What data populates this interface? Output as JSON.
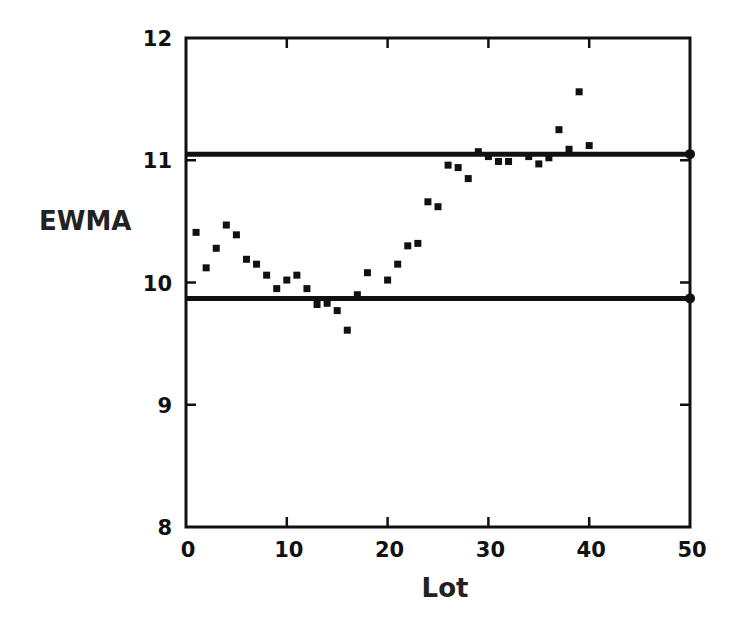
{
  "chart_data": {
    "type": "scatter",
    "title": "",
    "xlabel": "Lot",
    "ylabel": "EWMA",
    "xlim": [
      0,
      50
    ],
    "ylim": [
      8,
      12
    ],
    "xticks": [
      0,
      10,
      20,
      30,
      40,
      50
    ],
    "yticks": [
      8,
      9,
      10,
      11,
      12
    ],
    "xtick_labels": [
      "0",
      "10",
      "20",
      "30",
      "40",
      "50"
    ],
    "ytick_labels": [
      "8",
      "9",
      "10",
      "11",
      "12"
    ],
    "grid": false,
    "legend": null,
    "control_limits": {
      "upper": 11.05,
      "lower": 9.87
    },
    "series": [
      {
        "name": "EWMA",
        "marker": "square",
        "color": "#111111",
        "points": [
          [
            1,
            10.41
          ],
          [
            2,
            10.12
          ],
          [
            3,
            10.28
          ],
          [
            4,
            10.47
          ],
          [
            5,
            10.39
          ],
          [
            6,
            10.19
          ],
          [
            7,
            10.15
          ],
          [
            8,
            10.06
          ],
          [
            9,
            9.95
          ],
          [
            10,
            10.02
          ],
          [
            11,
            10.06
          ],
          [
            12,
            9.95
          ],
          [
            13,
            9.82
          ],
          [
            14,
            9.83
          ],
          [
            15,
            9.77
          ],
          [
            16,
            9.61
          ],
          [
            17,
            9.9
          ],
          [
            18,
            10.08
          ],
          [
            20,
            10.02
          ],
          [
            21,
            10.15
          ],
          [
            22,
            10.3
          ],
          [
            23,
            10.32
          ],
          [
            24,
            10.66
          ],
          [
            25,
            10.62
          ],
          [
            26,
            10.96
          ],
          [
            27,
            10.94
          ],
          [
            28,
            10.85
          ],
          [
            29,
            11.07
          ],
          [
            30,
            11.03
          ],
          [
            31,
            10.99
          ],
          [
            32,
            10.99
          ],
          [
            34,
            11.03
          ],
          [
            35,
            10.97
          ],
          [
            36,
            11.02
          ],
          [
            37,
            11.25
          ],
          [
            38,
            11.09
          ],
          [
            39,
            11.56
          ],
          [
            40,
            11.12
          ]
        ]
      }
    ]
  },
  "labels": {
    "x_axis_title": "Lot",
    "y_axis_title": "EWMA"
  },
  "colors": {
    "ink": "#111111",
    "background": "#ffffff"
  }
}
